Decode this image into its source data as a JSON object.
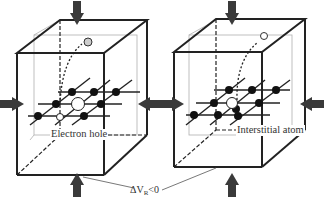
{
  "figure": {
    "panels": [
      {
        "id": "left",
        "defect_label": "Electron hole",
        "description": "Compressed lattice cube with an atom migrating out through the top face, leaving an electron hole (vacancy)"
      },
      {
        "id": "right",
        "defect_label": "Interstitial atom",
        "description": "Compressed lattice cube with an atom pushed into an interstitial position"
      }
    ],
    "shared_annotation": {
      "symbol": "ΔV",
      "subscript": "R",
      "relation": "<0"
    },
    "arrows": [
      "top-compression",
      "bottom-compression",
      "left-compression",
      "right-compression"
    ],
    "colors": {
      "lines": "#222222",
      "arrow": "#3a3a3a",
      "inner_box": "#aaaaaa",
      "atom_fill": "#111111",
      "vacancy_fill": "#ffffff"
    }
  }
}
